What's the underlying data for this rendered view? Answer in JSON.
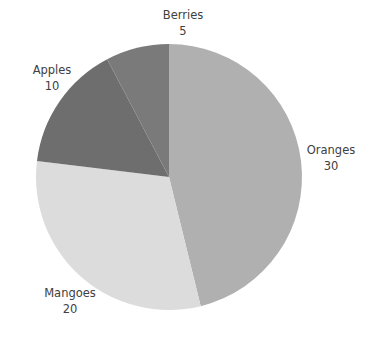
{
  "chart_data": {
    "type": "pie",
    "title": "",
    "categories": [
      "Oranges",
      "Mangoes",
      "Apples",
      "Berries"
    ],
    "values": [
      30,
      20,
      10,
      5
    ],
    "total": 65,
    "start_angle_deg": 0,
    "direction": "clockwise",
    "legend": "none",
    "labels_position": "outside",
    "grid": false,
    "background_color": "#ffffff",
    "label_text_color": "#404040",
    "slices": [
      {
        "name": "Oranges",
        "value": 30,
        "color": "#b0b0b0",
        "start_angle_deg": 0.0,
        "end_angle_deg": 166.2,
        "percent": 46.2
      },
      {
        "name": "Mangoes",
        "value": 20,
        "color": "#dcdcdc",
        "start_angle_deg": 166.2,
        "end_angle_deg": 276.9,
        "percent": 30.8
      },
      {
        "name": "Apples",
        "value": 10,
        "color": "#6e6e6e",
        "start_angle_deg": 276.9,
        "end_angle_deg": 332.3,
        "percent": 15.4
      },
      {
        "name": "Berries",
        "value": 5,
        "color": "#7a7a7a",
        "start_angle_deg": 332.3,
        "end_angle_deg": 360.0,
        "percent": 7.7
      }
    ],
    "geometry": {
      "center_x": 169,
      "center_y": 177,
      "radius": 133
    }
  },
  "labels": {
    "berries": {
      "name": "Berries",
      "value": "5"
    },
    "apples": {
      "name": "Apples",
      "value": "10"
    },
    "oranges": {
      "name": "Oranges",
      "value": "30"
    },
    "mangoes": {
      "name": "Mangoes",
      "value": "20"
    }
  }
}
